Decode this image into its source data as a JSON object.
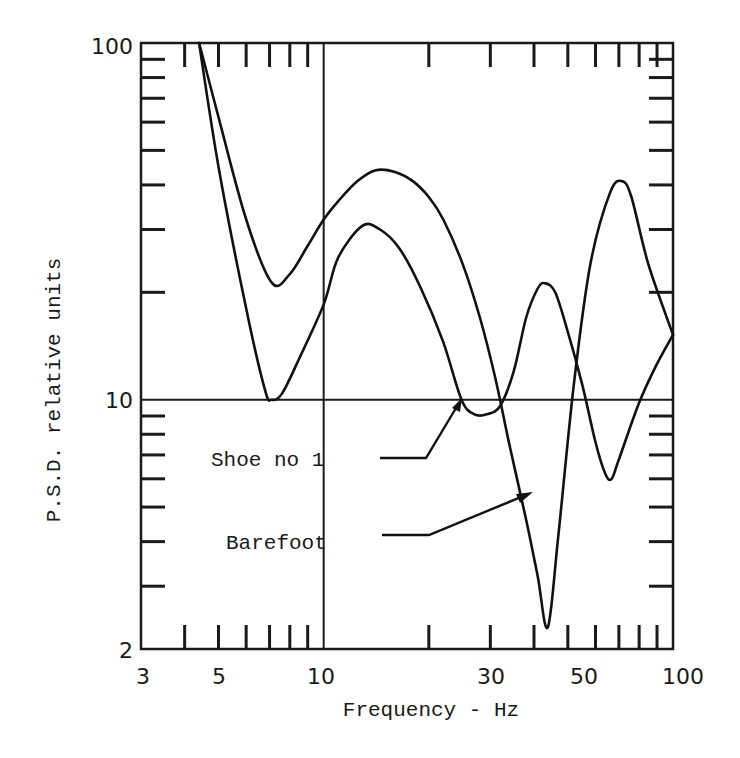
{
  "chart_data": {
    "type": "line",
    "title": "",
    "xlabel": "Frequency - Hz",
    "ylabel": "P.S.D. relative units",
    "xscale": "log",
    "yscale": "log",
    "xlim": [
      3,
      100
    ],
    "ylim": [
      2,
      100
    ],
    "grid": "major lines at x=10 and y=10 only",
    "x_tick_labels": [
      "3",
      "5",
      "10",
      "30",
      "50",
      "100"
    ],
    "x_tick_values": [
      3,
      5,
      10,
      30,
      50,
      100
    ],
    "y_tick_labels": [
      "2",
      "10",
      "100"
    ],
    "y_tick_values": [
      2,
      10,
      100
    ],
    "series": [
      {
        "name": "Barefoot",
        "points": [
          [
            4.4,
            100
          ],
          [
            5.0,
            62
          ],
          [
            6.0,
            32
          ],
          [
            7.1,
            21.3
          ],
          [
            8.0,
            22.5
          ],
          [
            9.0,
            27
          ],
          [
            10.0,
            32
          ],
          [
            11.0,
            36
          ],
          [
            12.5,
            41
          ],
          [
            14.1,
            44
          ],
          [
            16.0,
            43.5
          ],
          [
            18.0,
            41
          ],
          [
            20.0,
            37
          ],
          [
            22.0,
            32
          ],
          [
            25.0,
            24
          ],
          [
            28.0,
            17
          ],
          [
            31.0,
            11.5
          ],
          [
            34.0,
            7.5
          ],
          [
            38.0,
            4.6
          ],
          [
            41.0,
            3.2
          ],
          [
            43.8,
            2.3
          ],
          [
            47.0,
            4.2
          ],
          [
            52.0,
            11
          ],
          [
            58.0,
            24
          ],
          [
            66.0,
            38
          ],
          [
            71.4,
            41
          ],
          [
            76.0,
            37
          ],
          [
            85.0,
            24
          ],
          [
            100.0,
            15.2
          ]
        ]
      },
      {
        "name": "Shoe no 1",
        "points": [
          [
            4.4,
            100
          ],
          [
            5.0,
            45
          ],
          [
            6.0,
            18
          ],
          [
            6.8,
            10.6
          ],
          [
            7.1,
            10.0
          ],
          [
            7.6,
            10.4
          ],
          [
            8.5,
            13
          ],
          [
            10.0,
            18.5
          ],
          [
            11.0,
            25
          ],
          [
            12.9,
            30.7
          ],
          [
            14.5,
            30
          ],
          [
            16.5,
            26.5
          ],
          [
            19.0,
            20.5
          ],
          [
            22.0,
            14.5
          ],
          [
            24.8,
            10.0
          ],
          [
            27.0,
            9.1
          ],
          [
            29.3,
            9.1
          ],
          [
            32.0,
            9.6
          ],
          [
            35.0,
            12
          ],
          [
            38.0,
            17
          ],
          [
            41.0,
            20.5
          ],
          [
            43.0,
            21.2
          ],
          [
            46.0,
            20
          ],
          [
            50.0,
            15.5
          ],
          [
            55.0,
            11
          ],
          [
            60.0,
            7.6
          ],
          [
            64.0,
            6.2
          ],
          [
            66.7,
            6.0
          ],
          [
            70.0,
            6.8
          ],
          [
            80.0,
            9.8
          ],
          [
            90.0,
            12.6
          ],
          [
            100.0,
            15.2
          ]
        ]
      }
    ],
    "annotations": [
      {
        "text": "Shoe no 1",
        "arrow_to_x": 24.8,
        "arrow_to_y": 10.0
      },
      {
        "text": "Barefoot",
        "arrow_to_x": 40.0,
        "arrow_to_y": 4.5
      }
    ]
  },
  "labels": {
    "xlabel": "Frequency - Hz",
    "ylabel": "P.S.D. relative units",
    "x_ticks": [
      "3",
      "5",
      "10",
      "30",
      "50",
      "100"
    ],
    "y_ticks": [
      "2",
      "10",
      "100"
    ],
    "annot_shoe": "Shoe no 1",
    "annot_barefoot": "Barefoot"
  }
}
